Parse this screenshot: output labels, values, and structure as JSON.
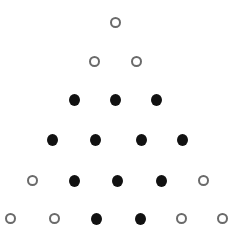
{
  "diagram": {
    "legend": {
      "open": "open circle",
      "filled": "filled circle"
    },
    "colors": {
      "open_stroke": "#6a6a6a",
      "filled": "#111111",
      "background": "#ffffff"
    },
    "rows": [
      {
        "y": 22,
        "dots": [
          {
            "x": 115,
            "type": "open"
          }
        ]
      },
      {
        "y": 61,
        "dots": [
          {
            "x": 94,
            "type": "open"
          },
          {
            "x": 136,
            "type": "open"
          }
        ]
      },
      {
        "y": 99,
        "dots": [
          {
            "x": 74,
            "type": "filled"
          },
          {
            "x": 115,
            "type": "filled"
          },
          {
            "x": 156,
            "type": "filled"
          }
        ]
      },
      {
        "y": 139,
        "dots": [
          {
            "x": 52,
            "type": "filled"
          },
          {
            "x": 95,
            "type": "filled"
          },
          {
            "x": 141,
            "type": "filled"
          },
          {
            "x": 182,
            "type": "filled"
          }
        ]
      },
      {
        "y": 180,
        "dots": [
          {
            "x": 32,
            "type": "open"
          },
          {
            "x": 74,
            "type": "filled"
          },
          {
            "x": 117,
            "type": "filled"
          },
          {
            "x": 161,
            "type": "filled"
          },
          {
            "x": 203,
            "type": "open"
          }
        ]
      },
      {
        "y": 218,
        "dots": [
          {
            "x": 10,
            "type": "open"
          },
          {
            "x": 54,
            "type": "open"
          },
          {
            "x": 96,
            "type": "filled"
          },
          {
            "x": 140,
            "type": "filled"
          },
          {
            "x": 181,
            "type": "open"
          },
          {
            "x": 222,
            "type": "open"
          }
        ]
      }
    ],
    "counts": {
      "open": 11,
      "filled": 10,
      "total": 21
    }
  }
}
